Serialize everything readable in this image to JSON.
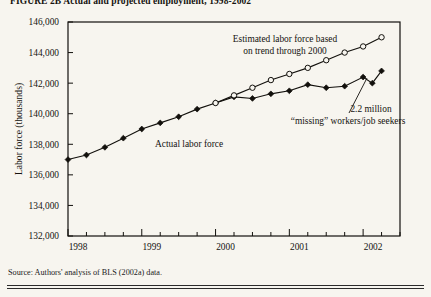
{
  "figure": {
    "title": "FIGURE 2B  Actual and projected employment, 1998-2002",
    "source_note": "Source: Authors' analysis of BLS (2002a) data."
  },
  "chart_data": {
    "type": "line",
    "title": "",
    "xlabel": "",
    "ylabel": "Labor force (thousands)",
    "ylim": [
      132000,
      146000
    ],
    "ytick_labels": [
      "146,000",
      "144,000",
      "142,000",
      "140,000",
      "138,000",
      "136,000",
      "134,000",
      "132,000"
    ],
    "ytick_values": [
      146000,
      144000,
      142000,
      140000,
      138000,
      136000,
      134000,
      132000
    ],
    "xtick_labels": [
      "1998",
      "1999",
      "2000",
      "2001",
      "2002"
    ],
    "xtick_values": [
      1998,
      1999,
      2000,
      2001,
      2002
    ],
    "x": [
      1998.0,
      1998.25,
      1998.5,
      1998.75,
      1999.0,
      1999.25,
      1999.5,
      1999.75,
      2000.0,
      2000.25,
      2000.5,
      2000.75,
      2001.0,
      2001.25,
      2001.5,
      2001.75,
      2002.0,
      2002.25
    ],
    "grid": false,
    "legend_position": "inline-annotations",
    "series": [
      {
        "name": "Actual labor force",
        "marker": "filled-diamond",
        "values": [
          137000,
          137300,
          137800,
          138400,
          139000,
          139400,
          139800,
          140300,
          140700,
          141100,
          141000,
          141300,
          141500,
          141900,
          141700,
          141800,
          142400,
          142000,
          142800
        ],
        "x_values": [
          1998.0,
          1998.25,
          1998.5,
          1998.75,
          1999.0,
          1999.25,
          1999.5,
          1999.75,
          2000.0,
          2000.25,
          2000.5,
          2000.75,
          2001.0,
          2001.25,
          2001.5,
          2001.75,
          2002.0,
          2002.125,
          2002.25
        ]
      },
      {
        "name": "Estimated labor force based on trend through 2000",
        "marker": "open-circle",
        "values": [
          140700,
          141200,
          141700,
          142200,
          142600,
          143000,
          143500,
          144000,
          144400,
          145000
        ],
        "x_values": [
          2000.0,
          2000.25,
          2000.5,
          2000.75,
          2001.0,
          2001.25,
          2001.5,
          2001.75,
          2002.0,
          2002.25
        ]
      }
    ],
    "annotations": [
      {
        "id": "estimated-label",
        "line1": "Estimated labor force based",
        "line2": "on trend through 2000"
      },
      {
        "id": "actual-label",
        "text": "Actual labor force"
      },
      {
        "id": "gap-label",
        "line1": "2.2 million",
        "line2": "“missing” workers/job seekers"
      }
    ]
  }
}
